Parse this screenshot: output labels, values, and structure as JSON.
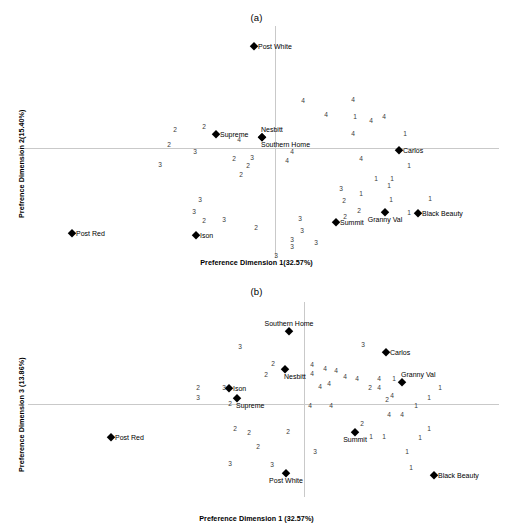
{
  "figure": {
    "panels": [
      {
        "id": "a",
        "title": "(a)",
        "xlabel": "Preference Dimension 1(32.57%)",
        "ylabel": "Prefrence Dimension 2(15.40%)",
        "axis": {
          "x_zero_px": 275,
          "y_zero_px": 148
        },
        "chart_data": {
          "type": "scatter",
          "title": "(a)",
          "xlabel": "Preference Dimension 1(32.57%)",
          "ylabel": "Prefrence Dimension 2(15.40%)",
          "grid": false,
          "legend": false,
          "axis_lines": "zero-crossing light gray",
          "brands": [
            {
              "label": "Post White",
              "x": 254,
              "y": 46,
              "anchor": "right"
            },
            {
              "label": "Supreme",
              "x": 216,
              "y": 134,
              "anchor": "right"
            },
            {
              "label": "Nesbitt",
              "x": 262,
              "y": 137,
              "anchor": "above"
            },
            {
              "label": "Southern Home",
              "x": 262,
              "y": 137,
              "anchor": "below"
            },
            {
              "label": "Carlos",
              "x": 399,
              "y": 150,
              "anchor": "right"
            },
            {
              "label": "Black Beauty",
              "x": 418,
              "y": 213,
              "anchor": "right"
            },
            {
              "label": "Granny Val",
              "x": 385,
              "y": 212,
              "anchor": "below-c"
            },
            {
              "label": "Summit",
              "x": 336,
              "y": 222,
              "anchor": "right"
            },
            {
              "label": "Ison",
              "x": 196,
              "y": 235,
              "anchor": "right"
            },
            {
              "label": "Post Red",
              "x": 72,
              "y": 233,
              "anchor": "right"
            }
          ],
          "cluster_points": [
            {
              "v": "4",
              "x": 303,
              "y": 101
            },
            {
              "v": "4",
              "x": 353,
              "y": 100
            },
            {
              "v": "4",
              "x": 326,
              "y": 115
            },
            {
              "v": "1",
              "x": 355,
              "y": 117
            },
            {
              "v": "4",
              "x": 371,
              "y": 121
            },
            {
              "v": "4",
              "x": 384,
              "y": 117
            },
            {
              "v": "2",
              "x": 175,
              "y": 130
            },
            {
              "v": "2",
              "x": 204,
              "y": 127
            },
            {
              "v": "4",
              "x": 353,
              "y": 134
            },
            {
              "v": "1",
              "x": 405,
              "y": 134
            },
            {
              "v": "4",
              "x": 239,
              "y": 140
            },
            {
              "v": "2",
              "x": 169,
              "y": 145
            },
            {
              "v": "3",
              "x": 195,
              "y": 152
            },
            {
              "v": "4",
              "x": 292,
              "y": 152
            },
            {
              "v": "2",
              "x": 234,
              "y": 159
            },
            {
              "v": "3",
              "x": 252,
              "y": 158
            },
            {
              "v": "4",
              "x": 287,
              "y": 161
            },
            {
              "v": "4",
              "x": 361,
              "y": 159
            },
            {
              "v": "3",
              "x": 160,
              "y": 165
            },
            {
              "v": "2",
              "x": 248,
              "y": 166
            },
            {
              "v": "1",
              "x": 409,
              "y": 166
            },
            {
              "v": "2",
              "x": 241,
              "y": 175
            },
            {
              "v": "1",
              "x": 376,
              "y": 179
            },
            {
              "v": "1",
              "x": 392,
              "y": 179
            },
            {
              "v": "1",
              "x": 389,
              "y": 186
            },
            {
              "v": "3",
              "x": 341,
              "y": 189
            },
            {
              "v": "1",
              "x": 361,
              "y": 194
            },
            {
              "v": "3",
              "x": 200,
              "y": 200
            },
            {
              "v": "2",
              "x": 344,
              "y": 201
            },
            {
              "v": "1",
              "x": 391,
              "y": 200
            },
            {
              "v": "1",
              "x": 430,
              "y": 199
            },
            {
              "v": "3",
              "x": 194,
              "y": 212
            },
            {
              "v": "2",
              "x": 359,
              "y": 211
            },
            {
              "v": "2",
              "x": 204,
              "y": 221
            },
            {
              "v": "3",
              "x": 224,
              "y": 220
            },
            {
              "v": "1",
              "x": 409,
              "y": 213
            },
            {
              "v": "2",
              "x": 345,
              "y": 217
            },
            {
              "v": "3",
              "x": 300,
              "y": 219
            },
            {
              "v": "2",
              "x": 256,
              "y": 228
            },
            {
              "v": "3",
              "x": 302,
              "y": 231
            },
            {
              "v": "3",
              "x": 292,
              "y": 240
            },
            {
              "v": "3",
              "x": 316,
              "y": 243
            },
            {
              "v": "3",
              "x": 292,
              "y": 247
            },
            {
              "v": "3",
              "x": 276,
              "y": 256
            }
          ]
        }
      },
      {
        "id": "b",
        "title": "(b)",
        "xlabel": "Preference Dimension 1 (32.57%)",
        "ylabel": "Preference Dimension 3 (13.86%)",
        "axis": {
          "x_zero_px": 304,
          "y_zero_px": 404
        },
        "chart_data": {
          "type": "scatter",
          "title": "(b)",
          "xlabel": "Preference Dimension 1 (32.57%)",
          "ylabel": "Preference Dimension 3 (13.86%)",
          "grid": false,
          "legend": false,
          "axis_lines": "zero-crossing light gray",
          "brands": [
            {
              "label": "Southern Home",
              "x": 289,
              "y": 331,
              "anchor": "above-c"
            },
            {
              "label": "Carlos",
              "x": 386,
              "y": 352,
              "anchor": "right"
            },
            {
              "label": "Nesbitt",
              "x": 285,
              "y": 369,
              "anchor": "below"
            },
            {
              "label": "Granny Val",
              "x": 402,
              "y": 382,
              "anchor": "above"
            },
            {
              "label": "Ison",
              "x": 229,
              "y": 388,
              "anchor": "right"
            },
            {
              "label": "Supreme",
              "x": 237,
              "y": 398,
              "anchor": "below"
            },
            {
              "label": "Post Red",
              "x": 111,
              "y": 437,
              "anchor": "right"
            },
            {
              "label": "Summit",
              "x": 355,
              "y": 432,
              "anchor": "below-c"
            },
            {
              "label": "Black Beauty",
              "x": 434,
              "y": 475,
              "anchor": "right"
            },
            {
              "label": "Post White",
              "x": 286,
              "y": 473,
              "anchor": "below-c"
            }
          ],
          "cluster_points": [
            {
              "v": "3",
              "x": 240,
              "y": 347
            },
            {
              "v": "3",
              "x": 363,
              "y": 345
            },
            {
              "v": "2",
              "x": 273,
              "y": 364
            },
            {
              "v": "4",
              "x": 312,
              "y": 365
            },
            {
              "v": "4",
              "x": 325,
              "y": 369
            },
            {
              "v": "4",
              "x": 336,
              "y": 371
            },
            {
              "v": "4",
              "x": 312,
              "y": 374
            },
            {
              "v": "2",
              "x": 266,
              "y": 375
            },
            {
              "v": "4",
              "x": 345,
              "y": 377
            },
            {
              "v": "4",
              "x": 357,
              "y": 379
            },
            {
              "v": "4",
              "x": 379,
              "y": 379
            },
            {
              "v": "1",
              "x": 394,
              "y": 379
            },
            {
              "v": "2",
              "x": 198,
              "y": 388
            },
            {
              "v": "3",
              "x": 224,
              "y": 388
            },
            {
              "v": "4",
              "x": 320,
              "y": 387
            },
            {
              "v": "4",
              "x": 329,
              "y": 384
            },
            {
              "v": "2",
              "x": 370,
              "y": 388
            },
            {
              "v": "4",
              "x": 379,
              "y": 388
            },
            {
              "v": "1",
              "x": 440,
              "y": 388
            },
            {
              "v": "3",
              "x": 198,
              "y": 398
            },
            {
              "v": "2",
              "x": 387,
              "y": 400
            },
            {
              "v": "4",
              "x": 392,
              "y": 396
            },
            {
              "v": "1",
              "x": 429,
              "y": 398
            },
            {
              "v": "2",
              "x": 230,
              "y": 404
            },
            {
              "v": "4",
              "x": 310,
              "y": 406
            },
            {
              "v": "4",
              "x": 331,
              "y": 406
            },
            {
              "v": "1",
              "x": 416,
              "y": 406
            },
            {
              "v": "4",
              "x": 389,
              "y": 415
            },
            {
              "v": "4",
              "x": 402,
              "y": 415
            },
            {
              "v": "2",
              "x": 235,
              "y": 429
            },
            {
              "v": "2",
              "x": 249,
              "y": 433
            },
            {
              "v": "2",
              "x": 288,
              "y": 432
            },
            {
              "v": "2",
              "x": 362,
              "y": 424
            },
            {
              "v": "1",
              "x": 429,
              "y": 429
            },
            {
              "v": "1",
              "x": 371,
              "y": 437
            },
            {
              "v": "1",
              "x": 384,
              "y": 437
            },
            {
              "v": "1",
              "x": 420,
              "y": 438
            },
            {
              "v": "2",
              "x": 258,
              "y": 447
            },
            {
              "v": "3",
              "x": 315,
              "y": 452
            },
            {
              "v": "1",
              "x": 407,
              "y": 452
            },
            {
              "v": "3",
              "x": 230,
              "y": 464
            },
            {
              "v": "3",
              "x": 272,
              "y": 465
            },
            {
              "v": "1",
              "x": 411,
              "y": 468
            }
          ]
        }
      }
    ]
  }
}
